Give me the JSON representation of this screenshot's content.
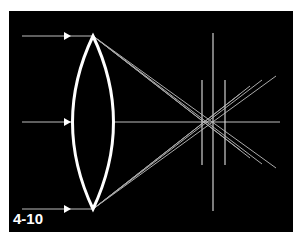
{
  "figure": {
    "label": "4-10",
    "colors": {
      "background": "#000000",
      "lens": "#ffffff",
      "rays": "#bfbfbf",
      "page": "#ffffff"
    },
    "elements": {
      "incoming_rays": [
        "top",
        "middle",
        "bottom"
      ],
      "lens": "biconvex-lens",
      "focal_markers": 3
    }
  }
}
